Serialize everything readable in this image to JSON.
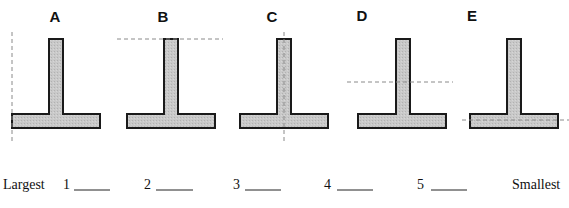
{
  "figure": {
    "shapes": [
      {
        "label": "A",
        "axis": "vertical through left edge of flange"
      },
      {
        "label": "B",
        "axis": "horizontal through top of stem"
      },
      {
        "label": "C",
        "axis": "vertical through centerline of stem"
      },
      {
        "label": "D",
        "axis": "horizontal through middle of stem"
      },
      {
        "label": "E",
        "axis": "horizontal through middle of flange"
      }
    ],
    "colors": {
      "fill": "#c8c8c8",
      "outline": "#1a1a1a",
      "axis": "#8a8a8a"
    }
  },
  "ranking": {
    "left_label": "Largest",
    "right_label": "Smallest",
    "slots": [
      {
        "number": "1",
        "value": ""
      },
      {
        "number": "2",
        "value": ""
      },
      {
        "number": "3",
        "value": ""
      },
      {
        "number": "4",
        "value": ""
      },
      {
        "number": "5",
        "value": ""
      }
    ]
  }
}
